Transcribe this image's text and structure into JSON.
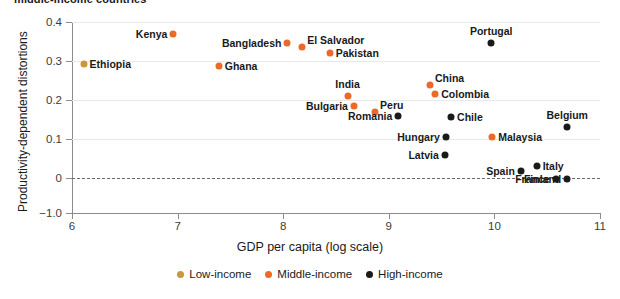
{
  "chart_data": {
    "type": "scatter",
    "title": "middle-income countries",
    "xlabel": "GDP per capita (log scale)",
    "ylabel": "Productivity-dependent distortions",
    "xlim": [
      6,
      11
    ],
    "xticks": [
      6,
      7,
      8,
      9,
      10,
      11
    ],
    "xtick_labels": [
      "6",
      "7",
      "8",
      "9",
      "10",
      "11"
    ],
    "yticks": [
      0.4,
      0.3,
      0.2,
      0.1,
      0,
      -1.0
    ],
    "ytick_labels": [
      "0.4",
      "0.3",
      "0.2",
      "0.1",
      "0",
      "−1.0"
    ],
    "grid": "horizontal",
    "zero_reference_line": 0,
    "legend_position": "bottom-center",
    "series": [
      {
        "name": "Low-income",
        "color": "#c8973f",
        "points": [
          {
            "label": "Ethiopia",
            "x": 6.11,
            "y": 0.292,
            "label_side": "right"
          }
        ]
      },
      {
        "name": "Middle-income",
        "color": "#eb6a28",
        "points": [
          {
            "label": "Kenya",
            "x": 6.96,
            "y": 0.369,
            "label_side": "left"
          },
          {
            "label": "Ghana",
            "x": 7.39,
            "y": 0.286,
            "label_side": "right"
          },
          {
            "label": "Bangladesh",
            "x": 8.04,
            "y": 0.345,
            "label_side": "left"
          },
          {
            "label": "El Salvador",
            "x": 8.18,
            "y": 0.335,
            "label_side": "top-right"
          },
          {
            "label": "Pakistan",
            "x": 8.44,
            "y": 0.321,
            "label_side": "right"
          },
          {
            "label": "India",
            "x": 8.61,
            "y": 0.211,
            "label_side": "top"
          },
          {
            "label": "Bulgaria",
            "x": 8.67,
            "y": 0.185,
            "label_side": "left"
          },
          {
            "label": "Peru",
            "x": 8.87,
            "y": 0.168,
            "label_side": "top-right"
          },
          {
            "label": "China",
            "x": 9.39,
            "y": 0.239,
            "label_side": "top-right"
          },
          {
            "label": "Colombia",
            "x": 9.44,
            "y": 0.216,
            "label_side": "right"
          },
          {
            "label": "Malaysia",
            "x": 9.98,
            "y": 0.104,
            "label_side": "right"
          }
        ]
      },
      {
        "name": "High-income",
        "color": "#1a1a1a",
        "points": [
          {
            "label": "Romania",
            "x": 9.09,
            "y": 0.16,
            "label_side": "left"
          },
          {
            "label": "Portugal",
            "x": 9.97,
            "y": 0.345,
            "label_side": "top"
          },
          {
            "label": "Chile",
            "x": 9.59,
            "y": 0.156,
            "label_side": "right"
          },
          {
            "label": "Hungary",
            "x": 9.54,
            "y": 0.104,
            "label_side": "left"
          },
          {
            "label": "Latvia",
            "x": 9.53,
            "y": 0.06,
            "label_side": "left"
          },
          {
            "label": "Belgium",
            "x": 10.69,
            "y": 0.132,
            "label_side": "top"
          },
          {
            "label": "Spain",
            "x": 10.25,
            "y": 0.018,
            "label_side": "left"
          },
          {
            "label": "Italy",
            "x": 10.4,
            "y": 0.031,
            "label_side": "right"
          },
          {
            "label": "Finland",
            "x": 10.69,
            "y": -0.03,
            "label_side": "left"
          },
          {
            "label": "France",
            "x": 10.58,
            "y": -0.04,
            "label_side": "left"
          }
        ]
      }
    ]
  }
}
